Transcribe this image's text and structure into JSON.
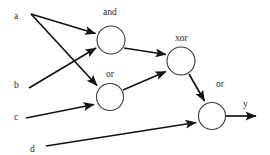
{
  "diagram": {
    "type": "logic-gate-network",
    "canvas": {
      "width": 270,
      "height": 155,
      "background": "#ffffff"
    },
    "stroke_color": "#141414",
    "node_stroke_color": "#3a3a3a",
    "text_color": "#2b2b2b",
    "inputs": [
      {
        "id": "a",
        "label": "a",
        "x": 14,
        "y": 12
      },
      {
        "id": "b",
        "label": "b",
        "x": 14,
        "y": 81
      },
      {
        "id": "c",
        "label": "c",
        "x": 14,
        "y": 113
      },
      {
        "id": "d",
        "label": "d",
        "x": 30,
        "y": 145
      }
    ],
    "outputs": [
      {
        "id": "y",
        "label": "y",
        "x": 243,
        "y": 100
      }
    ],
    "gates": [
      {
        "id": "gate_and",
        "label": "and",
        "cx": 111,
        "cy": 40,
        "r": 14,
        "label_x": 103,
        "label_y": 8
      },
      {
        "id": "gate_or1",
        "label": "or",
        "cx": 110,
        "cy": 97,
        "r": 13.5,
        "label_x": 106,
        "label_y": 70
      },
      {
        "id": "gate_xor",
        "label": "xor",
        "cx": 181,
        "cy": 61,
        "r": 14,
        "label_x": 175,
        "label_y": 34
      },
      {
        "id": "gate_or2",
        "label": "or",
        "cx": 212,
        "cy": 116,
        "r": 13.5,
        "label_x": 216,
        "label_y": 80
      }
    ],
    "edges": [
      {
        "id": "edge_a_and",
        "from": "a",
        "to": "gate_and",
        "x1": 31,
        "y1": 14,
        "x2": 97,
        "y2": 34
      },
      {
        "id": "edge_a_or1",
        "from": "a",
        "to": "gate_or1",
        "x1": 31,
        "y1": 14,
        "x2": 99,
        "y2": 87
      },
      {
        "id": "edge_b_and",
        "from": "b",
        "to": "gate_and",
        "x1": 29,
        "y1": 88,
        "x2": 98,
        "y2": 47
      },
      {
        "id": "edge_c_or1",
        "from": "c",
        "to": "gate_or1",
        "x1": 26,
        "y1": 118,
        "x2": 96,
        "y2": 104
      },
      {
        "id": "edge_and_xor",
        "from": "gate_and",
        "to": "gate_xor",
        "x1": 124,
        "y1": 48,
        "x2": 168,
        "y2": 55
      },
      {
        "id": "edge_or1_xor",
        "from": "gate_or1",
        "to": "gate_xor",
        "x1": 123,
        "y1": 90,
        "x2": 168,
        "y2": 71
      },
      {
        "id": "edge_xor_or2",
        "from": "gate_xor",
        "to": "gate_or2",
        "x1": 189,
        "y1": 74,
        "x2": 206,
        "y2": 103
      },
      {
        "id": "edge_d_or2",
        "from": "d",
        "to": "gate_or2",
        "x1": 46,
        "y1": 146,
        "x2": 198,
        "y2": 122
      },
      {
        "id": "edge_or2_y",
        "from": "gate_or2",
        "to": "y",
        "x1": 226,
        "y1": 116,
        "x2": 258,
        "y2": 116
      }
    ]
  }
}
